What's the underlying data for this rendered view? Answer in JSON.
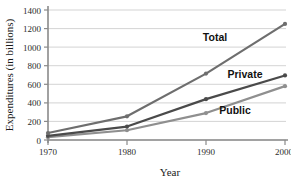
{
  "chart_data": {
    "type": "line",
    "title": "",
    "xlabel": "Year",
    "ylabel": "Expenditures (in billions)",
    "x": [
      1970,
      1980,
      1990,
      2000
    ],
    "xtick_labels": [
      "1970",
      "1980",
      "1990",
      "2000"
    ],
    "ytick_labels": [
      "0",
      "200",
      "400",
      "600",
      "800",
      "1000",
      "1200",
      "1400"
    ],
    "yticks": [
      0,
      200,
      400,
      600,
      800,
      1000,
      1200,
      1400
    ],
    "xlim": [
      1970,
      2000
    ],
    "ylim": [
      0,
      1400
    ],
    "grid": "horizontal",
    "legend_position": "inline-annotations",
    "series": [
      {
        "name": "Total",
        "label": "Total",
        "color": "#6e6e6e",
        "values": [
          75,
          255,
          715,
          1250
        ]
      },
      {
        "name": "Private",
        "label": "Private",
        "color": "#4a4a4a",
        "values": [
          45,
          145,
          440,
          695
        ]
      },
      {
        "name": "Public",
        "label": "Public",
        "color": "#8f8f8f",
        "values": [
          30,
          105,
          290,
          580
        ]
      }
    ]
  },
  "axes": {
    "y_title": "Expenditures (in billions)",
    "x_title": "Year",
    "y_ticks": [
      {
        "label": "1400",
        "value": 1400
      },
      {
        "label": "1200",
        "value": 1200
      },
      {
        "label": "1000",
        "value": 1000
      },
      {
        "label": "800",
        "value": 800
      },
      {
        "label": "600",
        "value": 600
      },
      {
        "label": "400",
        "value": 400
      },
      {
        "label": "200",
        "value": 200
      },
      {
        "label": "0",
        "value": 0
      }
    ],
    "x_ticks": [
      {
        "label": "1970",
        "value": 1970
      },
      {
        "label": "1980",
        "value": 1980
      },
      {
        "label": "1990",
        "value": 1990
      },
      {
        "label": "2000",
        "value": 2000
      }
    ]
  },
  "annotations": {
    "total_label": "Total",
    "private_label": "Private",
    "public_label": "Public"
  },
  "colors": {
    "total": "#6e6e6e",
    "private": "#4a4a4a",
    "public": "#8f8f8f",
    "grid": "#c8c8c8",
    "axis": "#8a8a8a",
    "text": "#1a1a1a",
    "background": "#ffffff"
  }
}
